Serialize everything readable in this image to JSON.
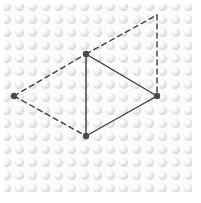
{
  "figure": {
    "canvas": {
      "width": 201,
      "height": 203
    },
    "background": {
      "kind": "dimpled-bump-texture",
      "description": "grid of small light-gray hemispherical bumps with top-left highlight",
      "base_color": "#fcfcfc",
      "bump_shadow_color": "#d9d9d9",
      "bump_highlight_color": "#ffffff",
      "bump_spacing_px": 13,
      "bump_radius_px": 5,
      "pattern_bounds": {
        "x": 4,
        "y": 4,
        "width": 188,
        "height": 188
      }
    },
    "stroke_color": "#3d3d3d",
    "stroke_width": 1.4,
    "dash_pattern": "5 4",
    "vertex_color": "#4a4a4a",
    "vertex_radius": 3.2,
    "vertices": [
      {
        "id": "top",
        "label": "top-vertex",
        "x": 86,
        "y": 54,
        "marker": true
      },
      {
        "id": "right",
        "label": "right-vertex",
        "x": 157,
        "y": 96,
        "marker": true
      },
      {
        "id": "bottom",
        "label": "bottom-vertex",
        "x": 86,
        "y": 136,
        "marker": true
      },
      {
        "id": "left",
        "label": "left-vertex",
        "x": 14,
        "y": 96,
        "marker": true
      },
      {
        "id": "topright",
        "label": "top-right-corner",
        "x": 157,
        "y": 15,
        "marker": false
      }
    ],
    "edges": [
      {
        "id": "top-bottom",
        "from": "top",
        "to": "bottom",
        "style": "solid"
      },
      {
        "id": "top-right",
        "from": "top",
        "to": "right",
        "style": "solid"
      },
      {
        "id": "right-bottom",
        "from": "right",
        "to": "bottom",
        "style": "solid"
      },
      {
        "id": "left-top",
        "from": "left",
        "to": "top",
        "style": "dashed"
      },
      {
        "id": "left-bottom",
        "from": "left",
        "to": "bottom",
        "style": "dashed"
      },
      {
        "id": "top-topright",
        "from": "top",
        "to": "topright",
        "style": "dashed"
      },
      {
        "id": "topright-right",
        "from": "topright",
        "to": "right",
        "style": "dashed"
      }
    ]
  }
}
